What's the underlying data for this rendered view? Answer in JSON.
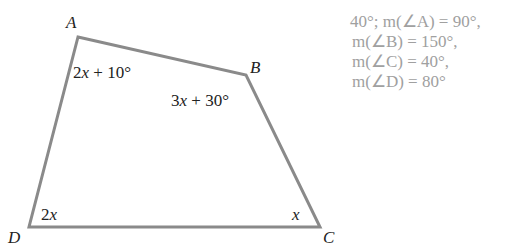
{
  "colors": {
    "edge": "#8a8a8a",
    "label": "#222222",
    "answer_text": "#a0a0a0"
  },
  "figure": {
    "type": "quadrilateral",
    "vertices": [
      {
        "name": "A",
        "label": "A"
      },
      {
        "name": "B",
        "label": "B"
      },
      {
        "name": "C",
        "label": "C"
      },
      {
        "name": "D",
        "label": "D"
      }
    ],
    "angle_labels": {
      "A": {
        "coef": "2",
        "var": "x",
        "rest": " + 10°"
      },
      "B": {
        "coef": "3",
        "var": "x",
        "rest": " + 30°"
      },
      "C": {
        "coef": "",
        "var": "x",
        "rest": ""
      },
      "D": {
        "coef": "2",
        "var": "x",
        "rest": ""
      }
    }
  },
  "answers": [
    "40°; m(∠A) = 90°,",
    "m(∠B) = 150°,",
    "m(∠C) = 40°,",
    "m(∠D) = 80°"
  ]
}
